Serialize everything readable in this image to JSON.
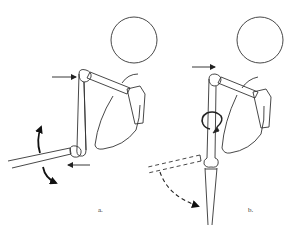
{
  "figure": {
    "panels": [
      {
        "id": "a",
        "label": "a.",
        "description": "Shoulder with arm abducted; forearm extended horizontally to the left with curved rotation arrows and a leftward push arrow at the elbow, and a rightward push arrow at the shoulder"
      },
      {
        "id": "b",
        "label": "b.",
        "description": "Shoulder with arm hanging vertically; circular rotation arrow around the upper arm, forearm shown vertical with dashed previous position and a dashed curved arrow indicating downward swing"
      }
    ],
    "colors": {
      "stroke": "#333333",
      "background": "#ffffff"
    }
  }
}
